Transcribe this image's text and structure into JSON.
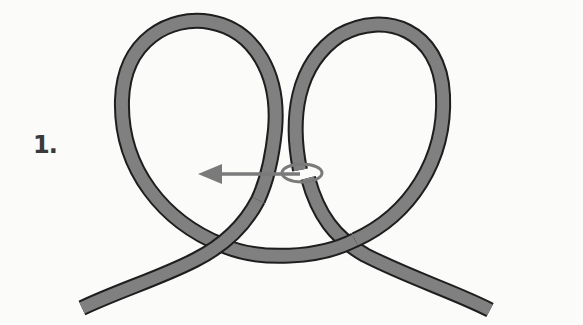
{
  "diagram": {
    "type": "knot-tying-step",
    "step_label": "1.",
    "rope_color": "#808080",
    "rope_outline_color": "#1e1e1e",
    "arrow_color": "#7a7a7a",
    "background_color": "#fbfbfa",
    "elements": [
      {
        "name": "left-loop",
        "description": "Rope loop on the left"
      },
      {
        "name": "right-loop",
        "description": "Rope loop on the right"
      },
      {
        "name": "left-tail",
        "description": "Left rope end, crosses over bottom arc"
      },
      {
        "name": "right-tail",
        "description": "Right rope end, passes under bottom arc"
      },
      {
        "name": "direction-arrow",
        "description": "Arrow pointing left from ellipse around right strand"
      },
      {
        "name": "wrap-indicator",
        "description": "Ellipse encircling right loop strand"
      }
    ]
  }
}
